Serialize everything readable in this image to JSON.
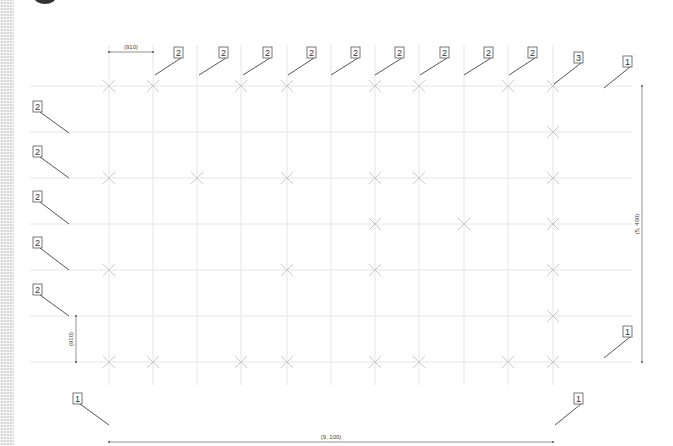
{
  "drawing": {
    "grid": {
      "columns_x": [
        109,
        153,
        197,
        241,
        287,
        331,
        375,
        419,
        464,
        508,
        553
      ],
      "rows_y": [
        86,
        132,
        178,
        224,
        270,
        316,
        362
      ],
      "x_extent": [
        30,
        632
      ],
      "y_extent": [
        45,
        385
      ]
    },
    "marks": [
      [
        109,
        86
      ],
      [
        153,
        86
      ],
      [
        241,
        86
      ],
      [
        287,
        86
      ],
      [
        375,
        86
      ],
      [
        419,
        86
      ],
      [
        508,
        86
      ],
      [
        553,
        86
      ],
      [
        553,
        132
      ],
      [
        109,
        178
      ],
      [
        197,
        178
      ],
      [
        287,
        178
      ],
      [
        375,
        178
      ],
      [
        419,
        178
      ],
      [
        553,
        178
      ],
      [
        375,
        224
      ],
      [
        464,
        224
      ],
      [
        553,
        224
      ],
      [
        109,
        270
      ],
      [
        287,
        270
      ],
      [
        375,
        270
      ],
      [
        553,
        270
      ],
      [
        553,
        316
      ],
      [
        109,
        362
      ],
      [
        153,
        362
      ],
      [
        241,
        362
      ],
      [
        287,
        362
      ],
      [
        375,
        362
      ],
      [
        419,
        362
      ],
      [
        508,
        362
      ],
      [
        553,
        362
      ]
    ],
    "callouts": [
      {
        "label": "2",
        "box": [
          178,
          47
        ],
        "tip": [
          155,
          75
        ]
      },
      {
        "label": "2",
        "box": [
          223,
          47
        ],
        "tip": [
          199,
          75
        ]
      },
      {
        "label": "2",
        "box": [
          267,
          47
        ],
        "tip": [
          243,
          75
        ]
      },
      {
        "label": "2",
        "box": [
          311,
          47
        ],
        "tip": [
          288,
          75
        ]
      },
      {
        "label": "2",
        "box": [
          355,
          47
        ],
        "tip": [
          331,
          75
        ]
      },
      {
        "label": "2",
        "box": [
          399,
          47
        ],
        "tip": [
          375,
          75
        ]
      },
      {
        "label": "2",
        "box": [
          444,
          47
        ],
        "tip": [
          420,
          75
        ]
      },
      {
        "label": "2",
        "box": [
          488,
          47
        ],
        "tip": [
          464,
          75
        ]
      },
      {
        "label": "2",
        "box": [
          532,
          47
        ],
        "tip": [
          509,
          75
        ]
      },
      {
        "label": "3",
        "box": [
          578,
          52
        ],
        "tip": [
          554,
          84
        ]
      },
      {
        "label": "1",
        "box": [
          627,
          56
        ],
        "tip": [
          604,
          88
        ]
      },
      {
        "label": "2",
        "box": [
          37,
          101
        ],
        "tip": [
          69,
          133
        ]
      },
      {
        "label": "2",
        "box": [
          37,
          146
        ],
        "tip": [
          69,
          178
        ]
      },
      {
        "label": "2",
        "box": [
          37,
          191
        ],
        "tip": [
          69,
          224
        ]
      },
      {
        "label": "2",
        "box": [
          37,
          237
        ],
        "tip": [
          69,
          270
        ]
      },
      {
        "label": "2",
        "box": [
          37,
          284
        ],
        "tip": [
          69,
          316
        ]
      },
      {
        "label": "1",
        "box": [
          627,
          326
        ],
        "tip": [
          604,
          358
        ]
      },
      {
        "label": "1",
        "box": [
          77,
          393
        ],
        "tip": [
          109,
          425
        ]
      },
      {
        "label": "1",
        "box": [
          578,
          393
        ],
        "tip": [
          555,
          425
        ]
      }
    ],
    "dimensions": {
      "top_span": {
        "text": "(910)",
        "x1": 109,
        "x2": 153,
        "y": 52
      },
      "right_span": {
        "text": "(5, 460)",
        "x": 642,
        "y1": 86,
        "y2": 362
      },
      "left_span": {
        "text": "(910)",
        "x": 76,
        "y1": 316,
        "y2": 362
      },
      "bottom_span": {
        "text": "(9, 100)",
        "x1": 109,
        "x2": 553,
        "y": 442
      }
    },
    "colors": {
      "grid": "#e6e6e6",
      "mark": "#c9c9c9",
      "leader": "#555555",
      "text": "#333333"
    }
  }
}
